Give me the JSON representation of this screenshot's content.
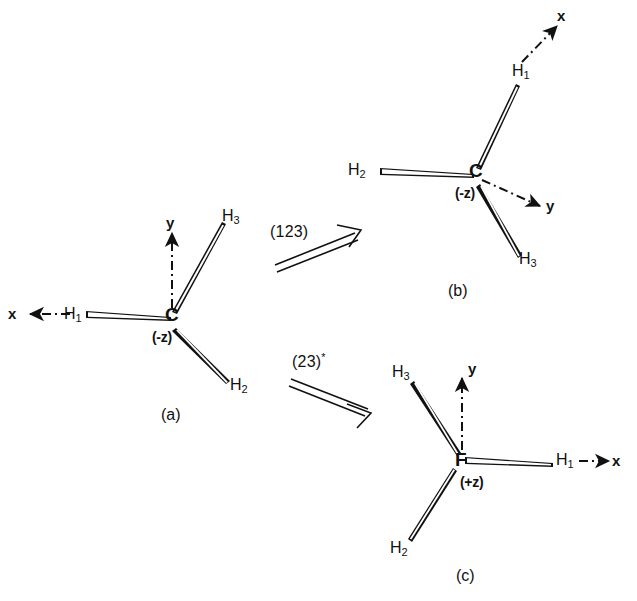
{
  "figure": {
    "type": "molecular-symmetry-operation-diagram",
    "background_color": "#ffffff",
    "line_color": "#111111",
    "structures": [
      {
        "id": "a",
        "caption": "(a)",
        "center_atom": "C",
        "center_z_label": "(-z)",
        "hydrogens": [
          {
            "label": "H",
            "index": "1",
            "position": "left"
          },
          {
            "label": "H",
            "index": "2",
            "position": "lower-right"
          },
          {
            "label": "H",
            "index": "3",
            "position": "upper-right"
          }
        ],
        "axes": [
          {
            "name": "x",
            "direction": "left"
          },
          {
            "name": "y",
            "direction": "up"
          }
        ]
      },
      {
        "id": "b",
        "caption": "(b)",
        "center_atom": "C",
        "center_z_label": "(-z)",
        "hydrogens": [
          {
            "label": "H",
            "index": "1",
            "position": "upper-right"
          },
          {
            "label": "H",
            "index": "2",
            "position": "left"
          },
          {
            "label": "H",
            "index": "3",
            "position": "lower-right"
          }
        ],
        "axes": [
          {
            "name": "x",
            "direction": "upper-right"
          },
          {
            "name": "y",
            "direction": "lower-right"
          }
        ]
      },
      {
        "id": "c",
        "caption": "(c)",
        "center_atom": "F",
        "center_z_label": "(+z)",
        "hydrogens": [
          {
            "label": "H",
            "index": "1",
            "position": "right"
          },
          {
            "label": "H",
            "index": "2",
            "position": "lower-left"
          },
          {
            "label": "H",
            "index": "3",
            "position": "upper-left"
          }
        ],
        "axes": [
          {
            "name": "x",
            "direction": "right"
          },
          {
            "name": "y",
            "direction": "up"
          }
        ]
      }
    ],
    "operations": [
      {
        "id": "op-123",
        "label": "(123)",
        "star": "",
        "from": "a",
        "to": "b",
        "direction": "up-right"
      },
      {
        "id": "op-23-star",
        "label": "(23)",
        "star": "*",
        "from": "a",
        "to": "c",
        "direction": "down-right"
      }
    ]
  },
  "text": {
    "a": {
      "atom": "C",
      "z": "(-z)",
      "h1": "H",
      "h1_sub": "1",
      "h2": "H",
      "h2_sub": "2",
      "h3": "H",
      "h3_sub": "3",
      "axis_x": "x",
      "axis_y": "y",
      "caption": "(a)"
    },
    "b": {
      "atom": "C",
      "z": "(-z)",
      "h1": "H",
      "h1_sub": "1",
      "h2": "H",
      "h2_sub": "2",
      "h3": "H",
      "h3_sub": "3",
      "axis_x": "x",
      "axis_y": "y",
      "caption": "(b)"
    },
    "c": {
      "atom": "F",
      "z": "(+z)",
      "h1": "H",
      "h1_sub": "1",
      "h2": "H",
      "h2_sub": "2",
      "h3": "H",
      "h3_sub": "3",
      "axis_x": "x",
      "axis_y": "y",
      "caption": "(c)"
    },
    "op1": {
      "label": "(123)"
    },
    "op2": {
      "label": "(23)",
      "star": "*"
    }
  }
}
